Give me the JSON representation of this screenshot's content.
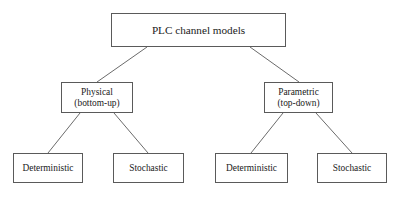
{
  "diagram": {
    "type": "tree",
    "orientation": "top-down",
    "canvas": {
      "width": 403,
      "height": 197,
      "background": "#ffffff"
    },
    "style": {
      "box_border_color": "#5a5a5a",
      "box_fill_color": "#ffffff",
      "connector_color": "#6b6b6b",
      "text_color": "#1a1a1a"
    },
    "nodes": {
      "root": {
        "id": "root",
        "label": "PLC channel models",
        "lines": [
          "PLC channel models"
        ],
        "level": 1
      },
      "physical": {
        "id": "physical",
        "label": "Physical (bottom-up)",
        "lines": [
          "Physical",
          "(bottom-up)"
        ],
        "line1": "Physical",
        "line2": "(bottom-up)",
        "level": 2
      },
      "parametric": {
        "id": "parametric",
        "label": "Parametric (top-down)",
        "lines": [
          "Parametric",
          "(top-down)"
        ],
        "line1": "Parametric",
        "line2": "(top-down)",
        "level": 2
      },
      "phys_deterministic": {
        "id": "phys_deterministic",
        "label": "Deterministic",
        "lines": [
          "Deterministic"
        ],
        "level": 3,
        "parent": "physical"
      },
      "phys_stochastic": {
        "id": "phys_stochastic",
        "label": "Stochastic",
        "lines": [
          "Stochastic"
        ],
        "level": 3,
        "parent": "physical"
      },
      "param_deterministic": {
        "id": "param_deterministic",
        "label": "Deterministic",
        "lines": [
          "Deterministic"
        ],
        "level": 3,
        "parent": "parametric"
      },
      "param_stochastic": {
        "id": "param_stochastic",
        "label": "Stochastic",
        "lines": [
          "Stochastic"
        ],
        "level": 3,
        "parent": "parametric"
      }
    },
    "edges": [
      {
        "from": "root",
        "to": "physical"
      },
      {
        "from": "root",
        "to": "parametric"
      },
      {
        "from": "physical",
        "to": "phys_deterministic"
      },
      {
        "from": "physical",
        "to": "phys_stochastic"
      },
      {
        "from": "parametric",
        "to": "param_deterministic"
      },
      {
        "from": "parametric",
        "to": "param_stochastic"
      }
    ]
  }
}
